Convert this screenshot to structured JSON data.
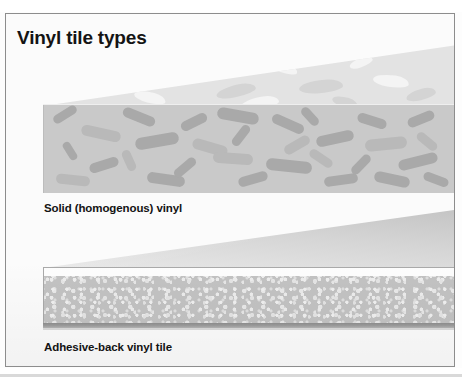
{
  "figure": {
    "title": "Vinyl tile types",
    "frame_border_color": "#8d8d8d",
    "background_color": "#fbfbfb"
  },
  "diagrams": [
    {
      "id": "solid-vinyl",
      "caption": "Solid (homogenous) vinyl",
      "layers": [
        {
          "name": "top-surface",
          "color": "#e3e3e3"
        },
        {
          "name": "homogeneous-body",
          "color": "#c9c9c9",
          "pattern_color": "#a9a9a9"
        }
      ]
    },
    {
      "id": "adhesive-back-vinyl-tile",
      "caption": "Adhesive-back vinyl tile",
      "layers": [
        {
          "name": "top-surface",
          "color": "#d5d5d5"
        },
        {
          "name": "wear-layer",
          "color": "#fdfdfd"
        },
        {
          "name": "speckled-vinyl-body",
          "color": "#c2c2c2"
        },
        {
          "name": "adhesive-backing",
          "color": "#9d9d9d"
        }
      ]
    }
  ],
  "colors": {
    "ink": "#131313",
    "light_gray": "#e3e3e3",
    "mid_gray": "#c9c9c9",
    "pattern_gray": "#a9a9a9",
    "dark_gray": "#8e8e8e"
  }
}
